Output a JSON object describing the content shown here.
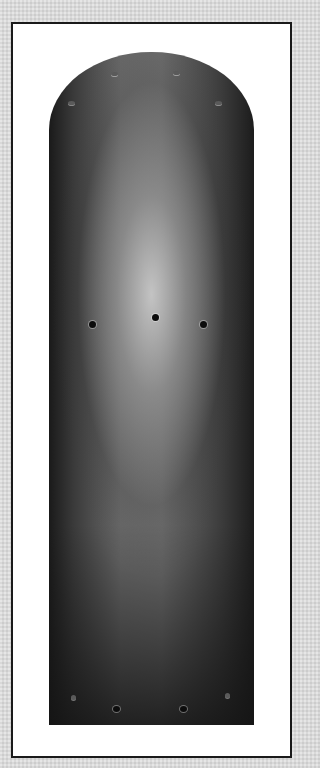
{
  "image": {
    "subject": "ceiling-fan-blade",
    "background_color": "#d9d9d9",
    "frame_color": "#ffffff",
    "frame_border_color": "#1a1a1a",
    "blade_color_dark": "#1a1a1a",
    "blade_color_highlight": "#c8c8c8"
  },
  "blade": {
    "mounting_holes": [
      {
        "x": 93,
        "y": 325
      },
      {
        "x": 156,
        "y": 318
      },
      {
        "x": 204,
        "y": 325
      }
    ],
    "top_studs": [
      {
        "x": 115,
        "y": 74
      },
      {
        "x": 177,
        "y": 73
      },
      {
        "x": 72,
        "y": 103
      },
      {
        "x": 219,
        "y": 103
      }
    ],
    "bottom_holes": [
      {
        "x": 74,
        "y": 697
      },
      {
        "x": 117,
        "y": 710
      },
      {
        "x": 184,
        "y": 710
      },
      {
        "x": 228,
        "y": 695
      }
    ]
  }
}
